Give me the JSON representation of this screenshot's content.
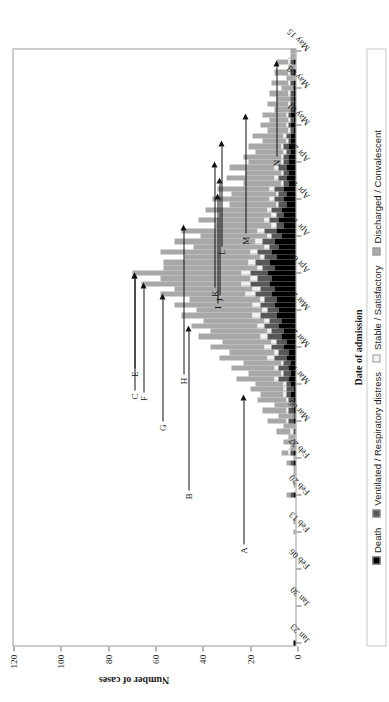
{
  "chart_data": {
    "type": "bar",
    "title": "",
    "subtitle": "",
    "xlabel": "Date of admission",
    "ylabel": "Number of cases",
    "ylim": [
      0,
      120
    ],
    "yticks": [
      0,
      20,
      40,
      60,
      80,
      100,
      120
    ],
    "ytick_labels": [
      "0",
      "20",
      "40",
      "60",
      "80",
      "100",
      "120"
    ],
    "grid": false,
    "stacked": true,
    "legend_position": "bottom",
    "tick_labels": [
      "Jan 23",
      "Jan 30",
      "Feb 06",
      "Feb 13",
      "Feb 20",
      "Feb 27",
      "Mar 06",
      "Mar 13",
      "Mar 20",
      "Mar 27",
      "Apr 03",
      "Apr 10",
      "Apr 17",
      "Apr 24",
      "May 01",
      "May 08",
      "May 15"
    ],
    "tick_indices": [
      0,
      7,
      14,
      21,
      28,
      35,
      42,
      49,
      56,
      63,
      70,
      77,
      84,
      91,
      98,
      105,
      112
    ],
    "series": [
      {
        "name": "Death",
        "color": "#000000",
        "values": [
          1,
          0,
          0,
          0,
          0,
          0,
          0,
          0,
          0,
          0,
          0,
          0,
          0,
          0,
          0,
          0,
          0,
          0,
          0,
          0,
          0,
          0,
          0,
          0,
          0,
          0,
          0,
          0,
          1,
          0,
          0,
          0,
          0,
          0,
          1,
          0,
          1,
          0,
          0,
          0,
          0,
          0,
          1,
          0,
          1,
          0,
          1,
          2,
          1,
          2,
          3,
          2,
          3,
          2,
          4,
          3,
          5,
          4,
          6,
          5,
          7,
          6,
          8,
          7,
          9,
          8,
          10,
          9,
          11,
          10,
          12,
          9,
          11,
          8,
          10,
          7,
          9,
          6,
          8,
          5,
          7,
          5,
          6,
          4,
          5,
          4,
          5,
          3,
          4,
          3,
          4,
          3,
          3,
          2,
          3,
          2,
          2,
          1,
          2,
          1,
          2,
          1,
          1,
          1,
          1,
          1,
          1,
          0,
          1,
          0,
          1,
          0,
          0
        ]
      },
      {
        "name": "Ventilated / Respiratory distress",
        "color": "#585858",
        "values": [
          0,
          0,
          0,
          0,
          0,
          0,
          0,
          0,
          0,
          0,
          0,
          0,
          0,
          0,
          0,
          0,
          0,
          0,
          0,
          0,
          0,
          0,
          0,
          0,
          0,
          0,
          0,
          0,
          1,
          0,
          0,
          0,
          0,
          0,
          1,
          0,
          1,
          0,
          1,
          0,
          1,
          0,
          2,
          1,
          2,
          1,
          2,
          2,
          3,
          2,
          4,
          3,
          4,
          3,
          5,
          4,
          5,
          4,
          6,
          5,
          6,
          5,
          7,
          5,
          6,
          5,
          7,
          6,
          8,
          6,
          7,
          5,
          6,
          5,
          6,
          4,
          5,
          4,
          5,
          3,
          4,
          3,
          4,
          3,
          4,
          3,
          4,
          2,
          3,
          2,
          3,
          2,
          2,
          2,
          2,
          1,
          2,
          1,
          1,
          1,
          1,
          1,
          1,
          1,
          1,
          0,
          1,
          0,
          1,
          0,
          1,
          0,
          0
        ]
      },
      {
        "name": "Stable / Satisfactory",
        "color": "#f2f2f2",
        "values": [
          0,
          0,
          0,
          0,
          0,
          0,
          0,
          0,
          0,
          0,
          0,
          0,
          0,
          0,
          0,
          0,
          0,
          0,
          0,
          0,
          0,
          0,
          0,
          0,
          0,
          0,
          0,
          0,
          0,
          0,
          0,
          0,
          0,
          0,
          0,
          0,
          1,
          0,
          0,
          0,
          1,
          0,
          1,
          0,
          1,
          0,
          1,
          1,
          1,
          1,
          2,
          1,
          2,
          1,
          3,
          2,
          3,
          2,
          3,
          2,
          3,
          2,
          3,
          2,
          3,
          2,
          4,
          3,
          4,
          3,
          4,
          2,
          3,
          2,
          3,
          2,
          3,
          2,
          3,
          2,
          2,
          2,
          2,
          1,
          2,
          1,
          2,
          1,
          2,
          1,
          2,
          1,
          1,
          1,
          1,
          1,
          1,
          1,
          1,
          1,
          1,
          0,
          1,
          0,
          1,
          0,
          1,
          0,
          1,
          0,
          1,
          0,
          0
        ]
      },
      {
        "name": "Discharged / Convalescent",
        "color": "#a8a8a8",
        "values": [
          0,
          0,
          0,
          0,
          0,
          0,
          0,
          0,
          0,
          0,
          0,
          0,
          0,
          0,
          0,
          0,
          0,
          0,
          0,
          0,
          0,
          1,
          0,
          1,
          0,
          0,
          0,
          0,
          2,
          0,
          1,
          0,
          1,
          1,
          2,
          1,
          3,
          2,
          4,
          3,
          6,
          5,
          8,
          6,
          10,
          8,
          12,
          10,
          14,
          12,
          16,
          14,
          18,
          16,
          20,
          19,
          23,
          21,
          26,
          24,
          28,
          26,
          30,
          28,
          33,
          30,
          36,
          33,
          42,
          38,
          46,
          40,
          36,
          32,
          38,
          30,
          34,
          28,
          32,
          24,
          28,
          22,
          26,
          20,
          24,
          19,
          22,
          16,
          20,
          15,
          19,
          14,
          16,
          12,
          14,
          10,
          13,
          9,
          11,
          8,
          10,
          7,
          9,
          6,
          8,
          5,
          7,
          4,
          6,
          3,
          5,
          2,
          2
        ]
      }
    ],
    "peak_bars": [
      {
        "index": 68,
        "total": 65
      },
      {
        "index": 70,
        "total": 69
      },
      {
        "index": 66,
        "total": 57
      }
    ],
    "annotations": [
      {
        "label": "B",
        "bar_index": 60,
        "y": 46
      },
      {
        "label": "C",
        "bar_index": 70,
        "y": 69
      },
      {
        "label": "E",
        "bar_index": 70,
        "y": 69
      },
      {
        "label": "F",
        "bar_index": 68,
        "y": 65
      },
      {
        "label": "G",
        "bar_index": 66,
        "y": 57
      },
      {
        "label": "H",
        "bar_index": 79,
        "y": 48
      },
      {
        "label": "I",
        "bar_index": 85,
        "y": 34
      },
      {
        "label": "J",
        "bar_index": 88,
        "y": 33
      },
      {
        "label": "K",
        "bar_index": 91,
        "y": 35
      },
      {
        "label": "L",
        "bar_index": 95,
        "y": 32
      },
      {
        "label": "M",
        "bar_index": 100,
        "y": 22
      },
      {
        "label": "N",
        "bar_index": 110,
        "y": 9
      },
      {
        "label": "A",
        "bar_index": 47,
        "y": 23
      }
    ]
  },
  "axis": {
    "ylabel": "Number of cases",
    "xlabel": "Date of admission"
  },
  "legend": {
    "items": [
      {
        "label": "Death",
        "color": "#000000"
      },
      {
        "label": "Ventilated / Respiratory distress",
        "color": "#585858"
      },
      {
        "label": "Stable / Satisfactory",
        "color": "#f2f2f2"
      },
      {
        "label": "Discharged / Convalescent",
        "color": "#a8a8a8"
      }
    ]
  }
}
